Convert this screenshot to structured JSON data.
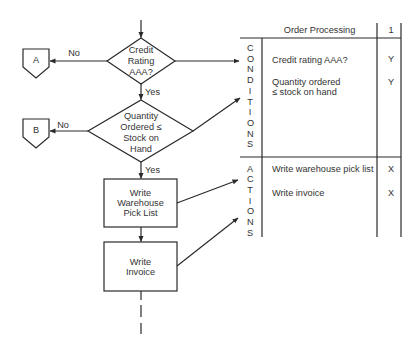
{
  "flowchart": {
    "decision_1": {
      "lines": [
        "Credit",
        "Rating",
        "AAA?"
      ],
      "no_label": "No",
      "yes_label": "Yes"
    },
    "connector_a": {
      "label": "A"
    },
    "decision_2": {
      "lines": [
        "Quantity",
        "Ordered ≤",
        "Stock on",
        "Hand"
      ],
      "no_label": "No",
      "yes_label": "Yes"
    },
    "connector_b": {
      "label": "B"
    },
    "process_1": {
      "lines": [
        "Write",
        "Warehouse",
        "Pick List"
      ]
    },
    "process_2": {
      "lines": [
        "Write",
        "Invoice"
      ]
    }
  },
  "decision_table": {
    "title": "Order Processing",
    "rule_header": "1",
    "conditions_label": "CONDITIONS",
    "conditions": [
      {
        "lines": [
          "Credit rating AAA?"
        ],
        "value": "Y"
      },
      {
        "lines": [
          "Quantity ordered",
          "≤ stock on hand"
        ],
        "value": "Y"
      }
    ],
    "actions_label": "ACTIONS",
    "actions": [
      {
        "text": "Write warehouse pick list",
        "value": "X"
      },
      {
        "text": "Write invoice",
        "value": "X"
      }
    ]
  },
  "colors": {
    "ink": "#2a2a2a",
    "text": "#333333",
    "background": "#ffffff"
  }
}
